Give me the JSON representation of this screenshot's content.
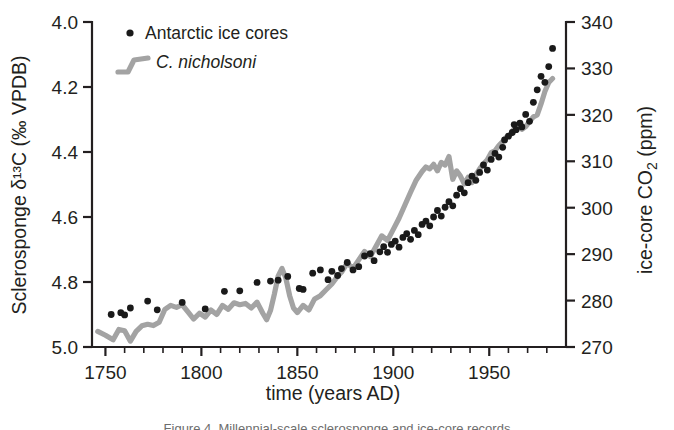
{
  "figure": {
    "caption_partial": "Figure 4. Millennial-scale sclerosponge and ice-core records"
  },
  "chart_data": {
    "type": "line",
    "title": "",
    "xlabel": "time (years AD)",
    "ylabel_left": "Sclerosponge δ¹³C (‰ VPDB)",
    "ylabel_right": "ice-core CO₂ (ppm)",
    "grid": false,
    "legend_position": "top-left",
    "xlim": [
      1743,
      1990
    ],
    "xticks_major": [
      1750,
      1800,
      1850,
      1900,
      1950
    ],
    "xticks_major_labels": [
      "1750",
      "1800",
      "1850",
      "1900",
      "1950"
    ],
    "xtick_minor_step": 10,
    "ylim_left": [
      4.0,
      5.0
    ],
    "ylim_left_inverted": true,
    "yticks_left": [
      4.0,
      4.2,
      4.4,
      4.6,
      4.8,
      5.0
    ],
    "yticks_left_labels": [
      "4.0",
      "4.2",
      "4.4",
      "4.6",
      "4.8",
      "5.0"
    ],
    "ylim_right": [
      270,
      340
    ],
    "yticks_right": [
      270,
      280,
      290,
      300,
      310,
      320,
      330,
      340
    ],
    "yticks_right_labels": [
      "270",
      "280",
      "290",
      "300",
      "310",
      "320",
      "330",
      "340"
    ],
    "series": [
      {
        "name": "Antarctic ice cores",
        "type": "scatter",
        "marker": "circle",
        "color": "#1a1a1a",
        "axis": "right",
        "unit": "ppm",
        "points": [
          [
            1753,
            277.0
          ],
          [
            1758,
            277.4
          ],
          [
            1760,
            276.9
          ],
          [
            1763,
            278.4
          ],
          [
            1772,
            279.9
          ],
          [
            1777,
            278.0
          ],
          [
            1790,
            279.6
          ],
          [
            1802,
            278.2
          ],
          [
            1812,
            282.0
          ],
          [
            1820,
            282.1
          ],
          [
            1829,
            283.9
          ],
          [
            1836,
            284.2
          ],
          [
            1840,
            284.4
          ],
          [
            1845,
            285.2
          ],
          [
            1851,
            282.6
          ],
          [
            1853,
            282.4
          ],
          [
            1858,
            285.9
          ],
          [
            1862,
            286.6
          ],
          [
            1866,
            284.5
          ],
          [
            1868,
            286.3
          ],
          [
            1871,
            285.4
          ],
          [
            1873,
            286.9
          ],
          [
            1876,
            288.2
          ],
          [
            1879,
            286.6
          ],
          [
            1882,
            287.3
          ],
          [
            1885,
            289.6
          ],
          [
            1888,
            290.1
          ],
          [
            1890,
            288.6
          ],
          [
            1893,
            290.5
          ],
          [
            1895,
            291.6
          ],
          [
            1897,
            290.4
          ],
          [
            1899,
            292.1
          ],
          [
            1901,
            292.8
          ],
          [
            1903,
            291.5
          ],
          [
            1905,
            293.6
          ],
          [
            1907,
            294.4
          ],
          [
            1909,
            293.2
          ],
          [
            1911,
            295.1
          ],
          [
            1913,
            294.2
          ],
          [
            1915,
            296.4
          ],
          [
            1917,
            297.1
          ],
          [
            1919,
            296.1
          ],
          [
            1921,
            298.0
          ],
          [
            1923,
            299.4
          ],
          [
            1925,
            298.2
          ],
          [
            1927,
            300.1
          ],
          [
            1929,
            301.3
          ],
          [
            1931,
            300.4
          ],
          [
            1933,
            302.7
          ],
          [
            1935,
            304.1
          ],
          [
            1937,
            303.2
          ],
          [
            1939,
            305.4
          ],
          [
            1941,
            306.8
          ],
          [
            1943,
            305.9
          ],
          [
            1945,
            307.6
          ],
          [
            1947,
            309.2
          ],
          [
            1949,
            308.1
          ],
          [
            1951,
            310.4
          ],
          [
            1953,
            311.7
          ],
          [
            1955,
            310.9
          ],
          [
            1957,
            313.0
          ],
          [
            1958,
            314.6
          ],
          [
            1960,
            315.4
          ],
          [
            1962,
            316.2
          ],
          [
            1963,
            317.9
          ],
          [
            1964,
            316.8
          ],
          [
            1966,
            318.2
          ],
          [
            1967,
            317.4
          ],
          [
            1969,
            320.1
          ],
          [
            1971,
            318.6
          ],
          [
            1973,
            322.7
          ],
          [
            1975,
            325.4
          ],
          [
            1977,
            328.3
          ],
          [
            1979,
            327.0
          ],
          [
            1981,
            330.4
          ],
          [
            1983,
            334.3
          ]
        ]
      },
      {
        "name": "C. nicholsoni",
        "type": "line",
        "color": "#a3a3a3",
        "axis": "left",
        "unit": "‰ VPDB",
        "points": [
          [
            1746,
            4.952
          ],
          [
            1750,
            4.964
          ],
          [
            1754,
            4.978
          ],
          [
            1757,
            4.946
          ],
          [
            1760,
            4.95
          ],
          [
            1763,
            4.982
          ],
          [
            1766,
            4.952
          ],
          [
            1769,
            4.935
          ],
          [
            1772,
            4.93
          ],
          [
            1775,
            4.934
          ],
          [
            1778,
            4.924
          ],
          [
            1781,
            4.884
          ],
          [
            1784,
            4.872
          ],
          [
            1787,
            4.878
          ],
          [
            1790,
            4.87
          ],
          [
            1793,
            4.892
          ],
          [
            1796,
            4.914
          ],
          [
            1799,
            4.896
          ],
          [
            1802,
            4.908
          ],
          [
            1805,
            4.886
          ],
          [
            1808,
            4.9
          ],
          [
            1811,
            4.872
          ],
          [
            1814,
            4.884
          ],
          [
            1817,
            4.864
          ],
          [
            1820,
            4.87
          ],
          [
            1823,
            4.866
          ],
          [
            1826,
            4.88
          ],
          [
            1829,
            4.862
          ],
          [
            1832,
            4.896
          ],
          [
            1834,
            4.916
          ],
          [
            1836,
            4.888
          ],
          [
            1838,
            4.838
          ],
          [
            1840,
            4.782
          ],
          [
            1842,
            4.758
          ],
          [
            1844,
            4.788
          ],
          [
            1846,
            4.842
          ],
          [
            1848,
            4.88
          ],
          [
            1850,
            4.894
          ],
          [
            1853,
            4.872
          ],
          [
            1856,
            4.886
          ],
          [
            1859,
            4.852
          ],
          [
            1862,
            4.842
          ],
          [
            1865,
            4.824
          ],
          [
            1868,
            4.806
          ],
          [
            1871,
            4.782
          ],
          [
            1873,
            4.77
          ],
          [
            1876,
            4.742
          ],
          [
            1879,
            4.758
          ],
          [
            1882,
            4.732
          ],
          [
            1885,
            4.706
          ],
          [
            1888,
            4.722
          ],
          [
            1891,
            4.69
          ],
          [
            1894,
            4.658
          ],
          [
            1897,
            4.672
          ],
          [
            1900,
            4.638
          ],
          [
            1903,
            4.604
          ],
          [
            1906,
            4.564
          ],
          [
            1909,
            4.524
          ],
          [
            1912,
            4.486
          ],
          [
            1915,
            4.46
          ],
          [
            1917,
            4.446
          ],
          [
            1919,
            4.452
          ],
          [
            1921,
            4.438
          ],
          [
            1923,
            4.458
          ],
          [
            1925,
            4.432
          ],
          [
            1927,
            4.44
          ],
          [
            1929,
            4.414
          ],
          [
            1931,
            4.484
          ],
          [
            1933,
            4.458
          ],
          [
            1935,
            4.474
          ],
          [
            1937,
            4.498
          ],
          [
            1939,
            4.478
          ],
          [
            1941,
            4.494
          ],
          [
            1943,
            4.47
          ],
          [
            1945,
            4.452
          ],
          [
            1947,
            4.436
          ],
          [
            1949,
            4.424
          ],
          [
            1951,
            4.402
          ],
          [
            1953,
            4.396
          ],
          [
            1955,
            4.38
          ],
          [
            1957,
            4.368
          ],
          [
            1959,
            4.354
          ],
          [
            1961,
            4.346
          ],
          [
            1963,
            4.328
          ],
          [
            1965,
            4.318
          ],
          [
            1967,
            4.33
          ],
          [
            1969,
            4.322
          ],
          [
            1971,
            4.306
          ],
          [
            1973,
            4.292
          ],
          [
            1975,
            4.286
          ],
          [
            1977,
            4.252
          ],
          [
            1979,
            4.214
          ],
          [
            1981,
            4.186
          ],
          [
            1983,
            4.174
          ]
        ]
      }
    ],
    "legend": [
      {
        "label": "Antarctic ice cores",
        "marker": "dot",
        "color": "#1a1a1a",
        "italic": false
      },
      {
        "label": "C. nicholsoni",
        "marker": "line",
        "color": "#a3a3a3",
        "italic": true
      }
    ]
  },
  "colors": {
    "axis": "#231f20",
    "line_gray": "#a3a3a3",
    "dot_black": "#1a1a1a",
    "background": "#ffffff"
  }
}
